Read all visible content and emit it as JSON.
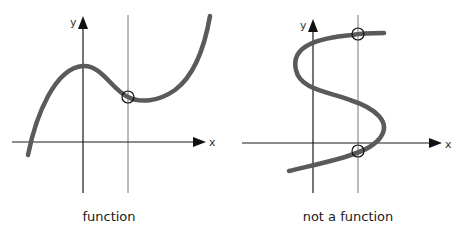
{
  "panels": [
    {
      "id": "function",
      "caption": "function",
      "x_axis_label": "x",
      "y_axis_label": "y",
      "description": "Cubic-like curve; a vertical line crosses it exactly once",
      "intersections_marked": 1
    },
    {
      "id": "not-a-function",
      "caption": "not a function",
      "x_axis_label": "x",
      "y_axis_label": "y",
      "description": "S-shaped curve; a vertical line crosses it at two points",
      "intersections_marked": 2
    }
  ],
  "colors": {
    "curve": "#5a5a5a",
    "axis": "#1a1a1a",
    "vertical_line": "#777777",
    "background": "#ffffff"
  }
}
